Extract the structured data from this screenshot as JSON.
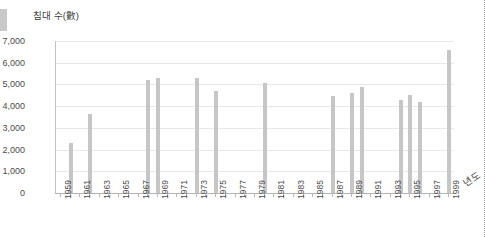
{
  "chart_data": {
    "type": "bar",
    "title": "",
    "ylabel": "침대 수(數)",
    "xlabel": "년도",
    "ylim": [
      0,
      7000
    ],
    "ytick_step": 1000,
    "yticks": [
      "0",
      "1,000",
      "2,000",
      "3,000",
      "4,000",
      "5,000",
      "6,000",
      "7,000"
    ],
    "ytick_values": [
      0,
      1000,
      2000,
      3000,
      4000,
      5000,
      6000,
      7000
    ],
    "grid": true,
    "grid_axis": "y",
    "legend": false,
    "bar_color": "#c6c6c6",
    "xlim": [
      1959,
      1999
    ],
    "xtick_labels": [
      "1959",
      "1961",
      "1963",
      "1965",
      "1967",
      "1969",
      "1971",
      "1973",
      "1975",
      "1977",
      "1979",
      "1981",
      "1983",
      "1985",
      "1987",
      "1989",
      "1991",
      "1993",
      "1995",
      "1997",
      "1999"
    ],
    "xtick_label_interval": 2,
    "categories": [
      1959,
      1960,
      1961,
      1962,
      1963,
      1964,
      1965,
      1966,
      1967,
      1968,
      1969,
      1970,
      1971,
      1972,
      1973,
      1974,
      1975,
      1976,
      1977,
      1978,
      1979,
      1980,
      1981,
      1982,
      1983,
      1984,
      1985,
      1986,
      1987,
      1988,
      1989,
      1990,
      1991,
      1992,
      1993,
      1994,
      1995,
      1996,
      1997,
      1998,
      1999
    ],
    "values": [
      0,
      2300,
      0,
      3650,
      0,
      0,
      0,
      0,
      0,
      5200,
      5300,
      0,
      0,
      0,
      5300,
      0,
      4700,
      0,
      0,
      0,
      0,
      5050,
      0,
      0,
      0,
      0,
      0,
      0,
      4450,
      0,
      4600,
      4900,
      0,
      0,
      0,
      4300,
      4500,
      4200,
      0,
      0,
      6600
    ]
  },
  "axis": {
    "y_label": "침대 수(數)",
    "x_label": "년도"
  }
}
